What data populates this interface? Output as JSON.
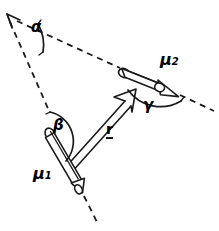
{
  "figure": {
    "background_color": "#ffffff",
    "ink_color": "#1a1a1a",
    "width": 219,
    "height": 231
  },
  "labels": {
    "alpha": "α",
    "beta": "β",
    "gamma": "γ",
    "mu1_symbol": "μ",
    "mu1_subscript": "1",
    "mu2_symbol": "μ",
    "mu2_subscript": "2",
    "r_vector": "r"
  },
  "elements": {
    "mu1_arrow": {
      "name": "mu1-dipole-arrow",
      "style": "3d-cylinder-with-cone-head",
      "direction_deg": 62,
      "tail": [
        48,
        133
      ],
      "tip": [
        82,
        192
      ]
    },
    "mu2_arrow": {
      "name": "mu2-dipole-arrow",
      "style": "3d-cylinder-with-cone-head",
      "direction_deg": 22,
      "tail": [
        124,
        72
      ],
      "tip": [
        177,
        98
      ]
    },
    "r_arrow": {
      "name": "r-separation-vector",
      "style": "open-line-arrow",
      "tail": [
        65,
        166
      ],
      "tip": [
        135,
        90
      ]
    },
    "dashed_mu1_extension": {
      "name": "mu1-extension-line",
      "from": [
        8,
        17
      ],
      "to": [
        96,
        217
      ]
    },
    "dashed_mu2_extension": {
      "name": "mu2-extension-line",
      "from": [
        8,
        17
      ],
      "to": [
        212,
        110
      ]
    },
    "apex_arrowhead": {
      "name": "apex-arrowhead",
      "at": [
        8,
        17
      ]
    }
  },
  "angles": {
    "alpha": {
      "label": "α",
      "vertex": [
        8,
        17
      ],
      "description": "angle at apex between the two dashed extension lines"
    },
    "beta": {
      "label": "β",
      "vertex": [
        48,
        133
      ],
      "description": "angle between mu1 direction and r vector"
    },
    "gamma": {
      "label": "γ",
      "vertex": [
        135,
        90
      ],
      "description": "angle between r vector and mu2 direction"
    }
  }
}
